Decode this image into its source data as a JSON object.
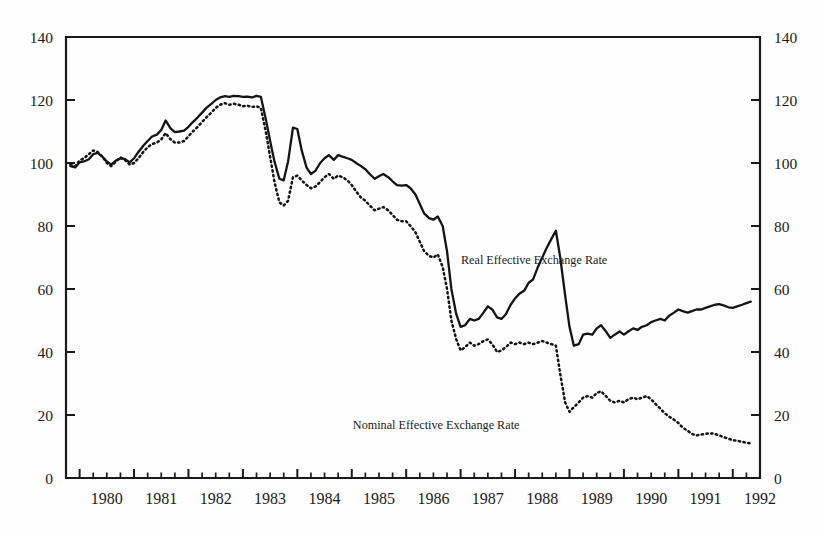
{
  "chart_data": {
    "type": "line",
    "title": "",
    "subtitle": "",
    "xlabel": "",
    "ylabel": "",
    "ylabel_right": "",
    "xlim": [
      1979.75,
      1992.5
    ],
    "ylim": [
      0,
      140
    ],
    "yticks": [
      0,
      20,
      40,
      60,
      80,
      100,
      120,
      140
    ],
    "yticklabels": [
      "0",
      "20",
      "40",
      "60",
      "80",
      "100",
      "120",
      "140"
    ],
    "yticklabels_right": [
      "0",
      "20",
      "40",
      "60",
      "80",
      "100",
      "120",
      "140"
    ],
    "xticklabels": [
      "1980",
      "1981",
      "1982",
      "1983",
      "1984",
      "1985",
      "1986",
      "1987",
      "1988",
      "1989",
      "1990",
      "1991",
      "1992"
    ],
    "xtick_years": [
      1980,
      1981,
      1982,
      1983,
      1984,
      1985,
      1986,
      1987,
      1988,
      1989,
      1990,
      1991,
      1992
    ],
    "minor_ticks_per_year": 4,
    "grid": false,
    "legend_position": "inline-annotation",
    "frame": "box",
    "annotations": [
      {
        "name": "real-series-label",
        "text": "Real Effective Exchange Rate",
        "x": 1988.35,
        "y": 68
      },
      {
        "name": "nominal-series-label",
        "text": "Nominal Effective Exchange Rate",
        "x": 1986.55,
        "y": 15.5
      }
    ],
    "series": [
      {
        "name": "Real Effective Exchange Rate",
        "style": "solid",
        "color": "#141414",
        "x": [
          1979.83,
          1979.92,
          1980.0,
          1980.08,
          1980.17,
          1980.25,
          1980.33,
          1980.42,
          1980.5,
          1980.58,
          1980.67,
          1980.75,
          1980.83,
          1980.92,
          1981.0,
          1981.08,
          1981.17,
          1981.25,
          1981.33,
          1981.42,
          1981.5,
          1981.58,
          1981.67,
          1981.75,
          1981.83,
          1981.92,
          1982.0,
          1982.08,
          1982.17,
          1982.25,
          1982.33,
          1982.42,
          1982.5,
          1982.58,
          1982.67,
          1982.75,
          1982.83,
          1982.92,
          1983.0,
          1983.08,
          1983.17,
          1983.25,
          1983.33,
          1983.42,
          1983.5,
          1983.58,
          1983.67,
          1983.75,
          1983.83,
          1983.92,
          1984.0,
          1984.08,
          1984.17,
          1984.25,
          1984.33,
          1984.42,
          1984.5,
          1984.58,
          1984.67,
          1984.75,
          1984.83,
          1984.92,
          1985.0,
          1985.08,
          1985.17,
          1985.25,
          1985.33,
          1985.42,
          1985.5,
          1985.58,
          1985.67,
          1985.75,
          1985.83,
          1985.92,
          1986.0,
          1986.08,
          1986.17,
          1986.25,
          1986.33,
          1986.42,
          1986.5,
          1986.58,
          1986.67,
          1986.75,
          1986.83,
          1986.92,
          1987.0,
          1987.08,
          1987.17,
          1987.25,
          1987.33,
          1987.42,
          1987.5,
          1987.58,
          1987.67,
          1987.75,
          1987.83,
          1987.92,
          1988.0,
          1988.08,
          1988.17,
          1988.25,
          1988.33,
          1988.42,
          1988.5,
          1988.58,
          1988.67,
          1988.75,
          1988.83,
          1988.92,
          1989.0,
          1989.08,
          1989.17,
          1989.25,
          1989.33,
          1989.42,
          1989.5,
          1989.58,
          1989.67,
          1989.75,
          1989.83,
          1989.92,
          1990.0,
          1990.08,
          1990.17,
          1990.25,
          1990.33,
          1990.42,
          1990.5,
          1990.58,
          1990.67,
          1990.75,
          1990.83,
          1990.92,
          1991.0,
          1991.08,
          1991.17,
          1991.25,
          1991.33,
          1991.42,
          1991.5,
          1991.58,
          1991.67,
          1991.75,
          1991.83,
          1991.92,
          1992.0,
          1992.08,
          1992.17,
          1992.25,
          1992.33
        ],
        "y": [
          99.0,
          98.6,
          100.2,
          100.5,
          101.2,
          102.8,
          103.2,
          102.0,
          100.5,
          99.5,
          100.8,
          101.5,
          101.3,
          100.2,
          101.5,
          103.5,
          105.5,
          107.0,
          108.4,
          109.0,
          110.5,
          113.5,
          111.0,
          109.8,
          110.0,
          110.3,
          111.5,
          113.0,
          114.5,
          116.0,
          117.5,
          118.8,
          120.0,
          120.8,
          121.2,
          121.0,
          121.3,
          121.2,
          121.0,
          121.1,
          120.8,
          121.3,
          121.0,
          114.0,
          107.0,
          100.5,
          95.0,
          94.5,
          100.5,
          111.2,
          110.8,
          104.0,
          98.5,
          96.5,
          97.5,
          100.0,
          101.5,
          102.5,
          101.0,
          102.5,
          102.0,
          101.5,
          101.0,
          100.0,
          99.0,
          98.0,
          96.5,
          95.0,
          95.8,
          96.5,
          95.5,
          94.2,
          93.0,
          92.8,
          93.0,
          92.0,
          90.0,
          87.0,
          84.0,
          82.5,
          82.0,
          83.0,
          80.0,
          72.0,
          60.0,
          52.0,
          48.0,
          48.5,
          50.5,
          50.0,
          50.5,
          52.5,
          54.5,
          53.5,
          51.0,
          50.5,
          52.0,
          55.0,
          57.0,
          58.5,
          59.5,
          62.0,
          63.0,
          67.0,
          70.0,
          73.0,
          76.0,
          78.5,
          70.0,
          58.0,
          48.0,
          42.0,
          42.5,
          45.5,
          45.8,
          45.5,
          47.5,
          48.5,
          46.5,
          44.5,
          45.5,
          46.5,
          45.5,
          46.5,
          47.5,
          47.0,
          48.0,
          48.5,
          49.5,
          50.0,
          50.5,
          50.0,
          51.5,
          52.5,
          53.5,
          53.0,
          52.5,
          53.0,
          53.5,
          53.5,
          54.0,
          54.5,
          55.0,
          55.2,
          54.8,
          54.2,
          54.0,
          54.5,
          55.0,
          55.5,
          56.0
        ]
      },
      {
        "name": "Nominal Effective Exchange Rate",
        "style": "dotted",
        "color": "#141414",
        "x": [
          1979.83,
          1979.92,
          1980.0,
          1980.08,
          1980.17,
          1980.25,
          1980.33,
          1980.42,
          1980.5,
          1980.58,
          1980.67,
          1980.75,
          1980.83,
          1980.92,
          1981.0,
          1981.08,
          1981.17,
          1981.25,
          1981.33,
          1981.42,
          1981.5,
          1981.58,
          1981.67,
          1981.75,
          1981.83,
          1981.92,
          1982.0,
          1982.08,
          1982.17,
          1982.25,
          1982.33,
          1982.42,
          1982.5,
          1982.58,
          1982.67,
          1982.75,
          1982.83,
          1982.92,
          1983.0,
          1983.08,
          1983.17,
          1983.25,
          1983.33,
          1983.42,
          1983.5,
          1983.58,
          1983.67,
          1983.75,
          1983.83,
          1983.92,
          1984.0,
          1984.08,
          1984.17,
          1984.25,
          1984.33,
          1984.42,
          1984.5,
          1984.58,
          1984.67,
          1984.75,
          1984.83,
          1984.92,
          1985.0,
          1985.08,
          1985.17,
          1985.25,
          1985.33,
          1985.42,
          1985.5,
          1985.58,
          1985.67,
          1985.75,
          1985.83,
          1985.92,
          1986.0,
          1986.08,
          1986.17,
          1986.25,
          1986.33,
          1986.42,
          1986.5,
          1986.58,
          1986.67,
          1986.75,
          1986.83,
          1986.92,
          1987.0,
          1987.08,
          1987.17,
          1987.25,
          1987.33,
          1987.42,
          1987.5,
          1987.58,
          1987.67,
          1987.75,
          1987.83,
          1987.92,
          1988.0,
          1988.08,
          1988.17,
          1988.25,
          1988.33,
          1988.42,
          1988.5,
          1988.58,
          1988.67,
          1988.75,
          1988.83,
          1988.92,
          1989.0,
          1989.08,
          1989.17,
          1989.25,
          1989.33,
          1989.42,
          1989.5,
          1989.58,
          1989.67,
          1989.75,
          1989.83,
          1989.92,
          1990.0,
          1990.08,
          1990.17,
          1990.25,
          1990.33,
          1990.42,
          1990.5,
          1990.58,
          1990.67,
          1990.75,
          1990.83,
          1990.92,
          1991.0,
          1991.08,
          1991.17,
          1991.25,
          1991.33,
          1991.42,
          1991.5,
          1991.58,
          1991.67,
          1991.75,
          1991.83,
          1991.92,
          1992.0,
          1992.08,
          1992.17,
          1992.25,
          1992.33
        ],
        "y": [
          99.5,
          99.0,
          100.8,
          101.5,
          102.8,
          104.0,
          103.5,
          102.0,
          100.0,
          99.0,
          100.5,
          101.8,
          101.0,
          99.5,
          100.0,
          101.5,
          103.5,
          105.0,
          106.0,
          106.5,
          107.5,
          109.5,
          107.5,
          106.5,
          106.5,
          107.0,
          108.5,
          110.0,
          111.5,
          113.0,
          114.5,
          116.0,
          117.5,
          118.5,
          119.0,
          118.5,
          118.8,
          118.5,
          118.0,
          118.2,
          117.8,
          118.0,
          117.5,
          110.0,
          102.0,
          94.0,
          87.5,
          86.5,
          88.0,
          95.5,
          96.0,
          94.5,
          93.0,
          92.0,
          92.5,
          94.0,
          95.5,
          96.5,
          95.0,
          96.0,
          95.5,
          94.5,
          93.0,
          91.0,
          89.0,
          88.0,
          86.5,
          85.0,
          85.5,
          86.0,
          85.0,
          83.5,
          82.0,
          81.5,
          81.5,
          80.0,
          78.0,
          75.0,
          72.0,
          70.5,
          70.0,
          71.0,
          67.0,
          60.0,
          50.0,
          44.0,
          40.5,
          41.5,
          43.0,
          42.0,
          42.5,
          43.5,
          44.0,
          42.5,
          40.0,
          40.5,
          41.5,
          43.0,
          42.5,
          43.0,
          42.5,
          43.0,
          42.5,
          43.0,
          43.5,
          43.0,
          42.5,
          42.0,
          33.0,
          24.0,
          21.0,
          22.5,
          24.0,
          25.5,
          26.0,
          25.5,
          27.0,
          27.5,
          26.0,
          24.5,
          24.0,
          24.5,
          24.0,
          25.0,
          25.5,
          25.0,
          25.5,
          26.0,
          25.0,
          23.5,
          22.0,
          20.5,
          19.5,
          18.5,
          17.5,
          16.0,
          15.0,
          14.0,
          13.5,
          13.8,
          14.0,
          14.2,
          14.0,
          13.5,
          13.0,
          12.5,
          12.0,
          11.8,
          11.5,
          11.2,
          11.0
        ]
      }
    ]
  }
}
